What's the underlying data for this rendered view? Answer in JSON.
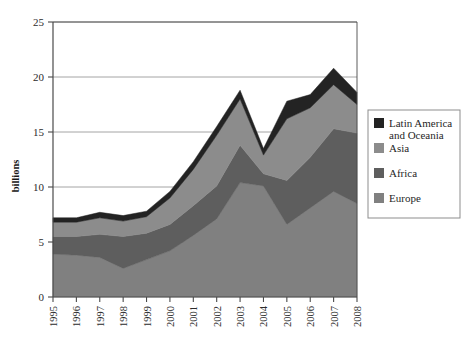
{
  "chart_data": {
    "type": "area",
    "stacked": true,
    "title": "",
    "subtitle": "",
    "xlabel": "",
    "ylabel": "billions",
    "categories": [
      "1995",
      "1996",
      "1997",
      "1998",
      "1999",
      "2000",
      "2001",
      "2002",
      "2003",
      "2004",
      "2005",
      "2006",
      "2007",
      "2008"
    ],
    "x": [
      1995,
      1996,
      1997,
      1998,
      1999,
      2000,
      2001,
      2002,
      2003,
      2004,
      2005,
      2006,
      2007,
      2008
    ],
    "ylim": [
      0,
      25
    ],
    "xlim": [
      1995,
      2008
    ],
    "yticks": [
      0,
      5,
      10,
      15,
      20,
      25
    ],
    "ytick_labels": [
      "0",
      "5",
      "10",
      "15",
      "20",
      "25"
    ],
    "grid": true,
    "grid_axis": "y",
    "legend_position": "right",
    "series": [
      {
        "name": "Europe",
        "color": "#808080",
        "values": [
          3.9,
          3.8,
          3.6,
          2.6,
          3.4,
          4.2,
          5.6,
          7.1,
          10.4,
          10.1,
          6.6,
          8.1,
          9.6,
          8.5
        ]
      },
      {
        "name": "Africa",
        "color": "#5e5e5e",
        "values": [
          1.6,
          1.7,
          2.1,
          2.9,
          2.4,
          2.4,
          2.7,
          3.0,
          3.4,
          1.1,
          4.0,
          4.6,
          5.7,
          6.4
        ]
      },
      {
        "name": "Asia",
        "color": "#8c8c8c",
        "values": [
          1.3,
          1.3,
          1.5,
          1.4,
          1.5,
          2.4,
          3.3,
          4.6,
          4.2,
          1.7,
          5.6,
          4.5,
          4.0,
          2.6
        ]
      },
      {
        "name": "Latin America and Oceania",
        "color": "#232323",
        "values": [
          0.4,
          0.4,
          0.5,
          0.5,
          0.5,
          0.6,
          0.7,
          0.8,
          0.8,
          0.6,
          1.6,
          1.2,
          1.5,
          1.1
        ]
      }
    ],
    "totals": [
      7.2,
      7.2,
      7.7,
      7.4,
      7.8,
      9.6,
      12.3,
      15.5,
      18.8,
      13.5,
      17.8,
      18.4,
      20.8,
      18.6
    ]
  },
  "legend": {
    "entries": [
      {
        "label": "Latin America",
        "label2": "and Oceania",
        "color": "#232323"
      },
      {
        "label": "Asia",
        "label2": "",
        "color": "#8c8c8c"
      },
      {
        "label": "Africa",
        "label2": "",
        "color": "#5e5e5e"
      },
      {
        "label": "Europe",
        "label2": "",
        "color": "#808080"
      }
    ]
  },
  "axis": {
    "y_title": "billions"
  },
  "colors": {
    "axis_line": "#4a4a4a",
    "grid_line": "#9a9a9a",
    "background": "#ffffff"
  }
}
